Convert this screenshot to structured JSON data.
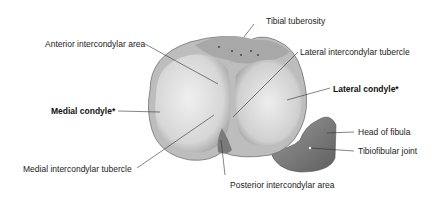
{
  "diagram": {
    "labels": {
      "tibial_tuberosity": "Tibial tuberosity",
      "anterior_intercondylar_area": "Anterior intercondylar area",
      "lateral_intercondylar_tubercle": "Lateral intercondylar tubercle",
      "lateral_condyle": "Lateral condyle*",
      "medial_condyle": "Medial condyle*",
      "head_of_fibula": "Head of fibula",
      "tibiofibular_joint": "Tibiofibular joint",
      "medial_intercondylar_tubercle": "Medial intercondylar tubercle",
      "posterior_intercondylar_area": "Posterior intercondylar area"
    },
    "colors": {
      "bone_light": "#e8e8e8",
      "bone_mid": "#b8b8b8",
      "bone_dark": "#6a6a6a",
      "fibula": "#8a8a8a",
      "leader_line": "#333333"
    }
  }
}
